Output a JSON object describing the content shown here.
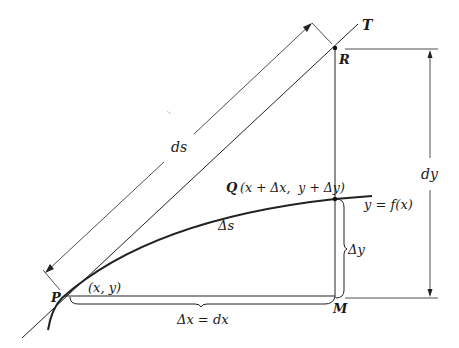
{
  "figure": {
    "colors": {
      "ink": "#222222",
      "background": "#ffffff"
    },
    "points": {
      "P": {
        "label": "P",
        "coords_label": "(x, y)"
      },
      "Q": {
        "label": "Q",
        "coords_label": "(x + Δx,  y + Δy)"
      },
      "R": {
        "label": "R"
      },
      "M": {
        "label": "M"
      },
      "T": {
        "label": "T"
      }
    },
    "labels": {
      "ds": "ds",
      "dy": "dy",
      "delta_s": "Δs",
      "delta_y": "Δy",
      "delta_x_eq_dx": "Δx = dx",
      "curve": "y = f(x)"
    }
  }
}
